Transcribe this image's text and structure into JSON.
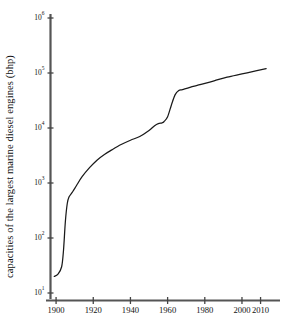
{
  "chart_data": {
    "type": "line",
    "title": "",
    "xlabel": "",
    "ylabel": "capacities of the largest marine diesel engines (bhp)",
    "yscale": "log",
    "xlim": [
      1897,
      2014
    ],
    "ylim": [
      10,
      1000000
    ],
    "grid": false,
    "legend": null,
    "xticks": [
      1900,
      1920,
      1940,
      1960,
      1980,
      2000,
      2010
    ],
    "xtick_labels": [
      "1900",
      "1920",
      "1940",
      "1960",
      "1980",
      "2000",
      "2010"
    ],
    "yticks": [
      10,
      100,
      1000,
      10000,
      100000,
      1000000
    ],
    "ytick_labels": [
      "10¹",
      "10²",
      "10³",
      "10⁴",
      "10⁵",
      "10⁶"
    ],
    "ytick_mantissa": [
      "10",
      "10",
      "10",
      "10",
      "10",
      "10"
    ],
    "ytick_exponent": [
      "1",
      "2",
      "3",
      "4",
      "5",
      "6"
    ],
    "series": [
      {
        "name": "largest marine diesel engine capacity",
        "line_color": "#1a1a1a",
        "x": [
          1899,
          1901,
          1903,
          1904,
          1905,
          1906,
          1907,
          1909,
          1911,
          1914,
          1918,
          1922,
          1926,
          1930,
          1935,
          1940,
          1945,
          1950,
          1953,
          1955,
          1957,
          1958,
          1960,
          1962,
          1964,
          1966,
          1968,
          1972,
          1978,
          1985,
          1992,
          2000,
          2008,
          2013
        ],
        "y": [
          20,
          22,
          30,
          60,
          200,
          420,
          560,
          700,
          900,
          1300,
          1900,
          2600,
          3300,
          4000,
          5000,
          6000,
          7000,
          9000,
          11000,
          12000,
          12400,
          13000,
          16000,
          26000,
          40000,
          48000,
          50000,
          55000,
          62000,
          72000,
          84000,
          96000,
          110000,
          120000
        ]
      }
    ],
    "annotations": []
  },
  "axes": {
    "y_axis_color": "#555555",
    "x_axis_color": "#555555",
    "background": "#ffffff"
  }
}
